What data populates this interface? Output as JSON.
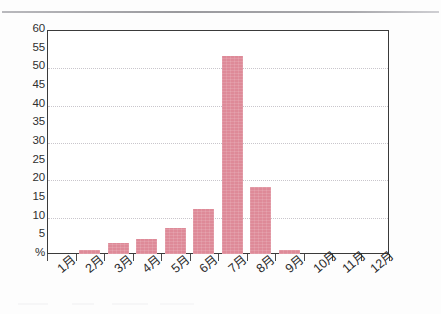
{
  "chart_data": {
    "type": "bar",
    "title": "",
    "xlabel": "",
    "ylabel": "%",
    "categories": [
      "1月",
      "2月",
      "3月",
      "4月",
      "5月",
      "6月",
      "7月",
      "8月",
      "9月",
      "10月",
      "11月",
      "12月"
    ],
    "values": [
      0,
      1,
      3,
      4,
      7,
      12,
      53,
      18,
      1,
      0,
      0,
      0
    ],
    "ylim": [
      0,
      60
    ],
    "ytick_values": [
      0,
      5,
      10,
      15,
      20,
      25,
      30,
      35,
      40,
      45,
      50,
      55,
      60
    ],
    "ytick_labels": [
      "%",
      "5",
      "10",
      "15",
      "20",
      "25",
      "30",
      "35",
      "40",
      "45",
      "50",
      "55",
      "60"
    ],
    "grid": true,
    "gridline_values": [
      10,
      20,
      30,
      40,
      50
    ],
    "legend": [],
    "bar_color": "#de8a98",
    "axis_color": "#3a3a3a",
    "gridline_color": "#c9c6cc"
  },
  "page": {
    "background": "#fdfdfd",
    "rule_color": "#9a9a9e"
  }
}
